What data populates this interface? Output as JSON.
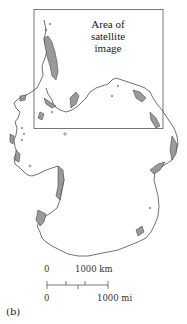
{
  "map": {
    "subject": "Antarctica outline with shaded ice-free/mountain regions",
    "inset_box": {
      "label_lines": [
        "Area of",
        "satellite",
        "image"
      ]
    },
    "scale_bar": {
      "km_start": "0",
      "km_end": "1000  km",
      "mi_start": "0",
      "mi_end": "1000  mi"
    },
    "figure_label": "(b)",
    "colors": {
      "outline": "#333333",
      "shading": "#9a9a9a",
      "box": "#555555"
    }
  }
}
